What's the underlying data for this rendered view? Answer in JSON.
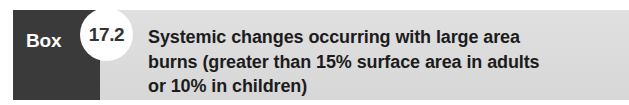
{
  "callout": {
    "label": "Box",
    "number": "17.2",
    "title_lines": [
      "Systemic changes occurring with large area",
      "burns (greater than 15% surface area in adults",
      "or 10% in children)"
    ],
    "title_full": "Systemic changes occurring with large area burns (greater than 15% surface area in adults or 10% in children)",
    "colors": {
      "label_block": "#3a3a3a",
      "label_text": "#ffffff",
      "banner": "#dcdcdc",
      "circle": "#ffffff",
      "number_text": "#333333",
      "title_text": "#1c1c1c",
      "page_background": "#ffffff"
    }
  }
}
